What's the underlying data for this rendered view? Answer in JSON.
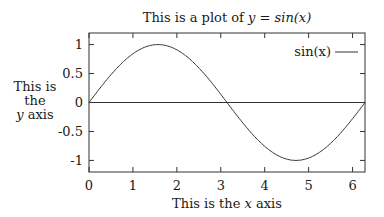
{
  "chart_data": {
    "type": "line",
    "title": "This is a plot of y = sin(x)",
    "title_parts": {
      "prefix": "This is a plot of ",
      "math": "y = sin(x)"
    },
    "xlabel": "This is the x axis",
    "xlabel_parts": {
      "prefix": "This is the ",
      "var": "x",
      "suffix": " axis"
    },
    "ylabel": "This is the y axis",
    "ylabel_lines": [
      "This is",
      "the",
      "y axis"
    ],
    "xlim": [
      0,
      6.2832
    ],
    "ylim": [
      -1.2,
      1.2
    ],
    "xticks": [
      0,
      1,
      2,
      3,
      4,
      5,
      6
    ],
    "xtick_labels": [
      "0",
      "1",
      "2",
      "3",
      "4",
      "5",
      "6"
    ],
    "yticks": [
      1,
      0.5,
      0,
      -0.5,
      -1
    ],
    "ytick_labels": [
      "1",
      "0.5",
      "0",
      "-0.5",
      "-1"
    ],
    "grid": false,
    "zero_line": true,
    "legend": {
      "position": "top-right",
      "entries": [
        "sin(x)"
      ]
    },
    "series": [
      {
        "name": "sin(x)",
        "function": "sin(x)",
        "x": [
          0,
          0.5,
          1.0,
          1.5708,
          2.0,
          2.5,
          3.1416,
          3.5,
          4.0,
          4.7124,
          5.0,
          5.5,
          6.2832
        ],
        "values": [
          0,
          0.479,
          0.841,
          1.0,
          0.909,
          0.598,
          0,
          -0.351,
          -0.757,
          -1.0,
          -0.959,
          -0.706,
          0
        ],
        "color": "#333333"
      }
    ]
  }
}
